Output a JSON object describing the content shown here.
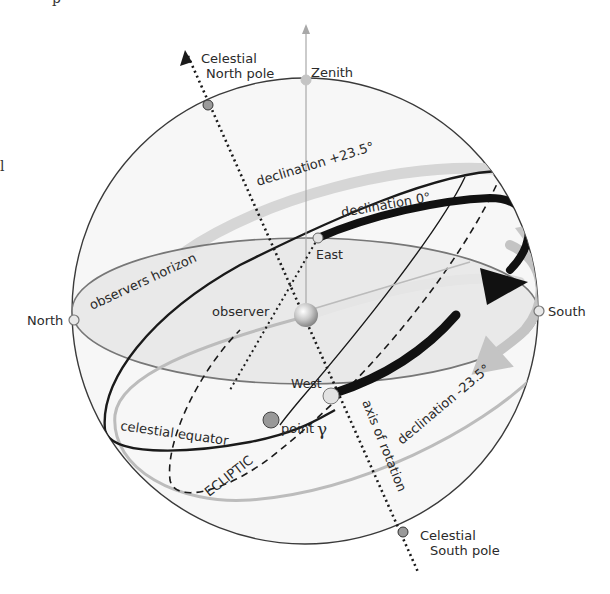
{
  "diagram": {
    "type": "celestial-sphere",
    "colors": {
      "sphere_outline": "#3a3a3a",
      "sphere_fill": "#f7f7f7",
      "horizon_fill": "#e6e6e6",
      "horizon_outline": "#777777",
      "declination_band": "#d6d6d6",
      "declination_arrow": "#bdbdbd",
      "equator": "#1a1a1a",
      "axis": "#1a1a1a",
      "zenith_line": "#a8a8a8",
      "pole_marker": "#9a9a9a",
      "cardinal_marker": "#e2e2e2",
      "point_gamma_marker": "#999999"
    },
    "labels": {
      "celestial_north_pole_line1": "Celestial",
      "celestial_north_pole_line2": "North pole",
      "zenith": "Zenith",
      "declination_plus": "declination  +23.5°",
      "declination_zero": "declination  0°",
      "declination_minus": "declination  -23.5°",
      "observers_horizon": "observers  horizon",
      "east": "East",
      "west": "West",
      "north": "North",
      "south": "South",
      "observer": "observer",
      "celestial_equator": "celestial  equator",
      "point": "point",
      "gamma": "γ",
      "ecliptic": "ECLIPTIC",
      "axis_of_rotation": "axis of rotation",
      "celestial_south_pole_line1": "Celestial",
      "celestial_south_pole_line2": "South pole"
    },
    "edge_fragments": {
      "top": "p",
      "left": "l"
    }
  }
}
